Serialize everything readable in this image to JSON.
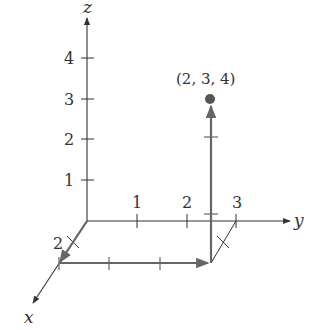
{
  "diagram": {
    "type": "3d-coordinate-axes",
    "axes": {
      "x": {
        "label": "x",
        "ticks": [
          1,
          2
        ],
        "tick_labels": [
          "2"
        ]
      },
      "y": {
        "label": "y",
        "ticks": [
          1,
          2,
          3
        ],
        "tick_labels": [
          "1",
          "2",
          "3"
        ]
      },
      "z": {
        "label": "z",
        "ticks": [
          1,
          2,
          3,
          4
        ],
        "tick_labels": [
          "1",
          "2",
          "3",
          "4"
        ]
      }
    },
    "point": {
      "label": "(2, 3, 4)",
      "coords": [
        2,
        3,
        4
      ],
      "color": "#555555"
    },
    "path": [
      {
        "from": [
          0,
          0,
          0
        ],
        "to": [
          2,
          0,
          0
        ],
        "note": "along x"
      },
      {
        "from": [
          2,
          0,
          0
        ],
        "to": [
          2,
          3,
          0
        ],
        "note": "parallel to y"
      },
      {
        "from": [
          2,
          3,
          0
        ],
        "to": [
          2,
          3,
          4
        ],
        "note": "parallel to z"
      }
    ],
    "colors": {
      "axes": "#333333",
      "path": "#666666",
      "point": "#555555"
    }
  },
  "labels": {
    "z_axis": "z",
    "y_axis": "y",
    "x_axis": "x",
    "z1": "1",
    "z2": "2",
    "z3": "3",
    "z4": "4",
    "y1": "1",
    "y2": "2",
    "y3": "3",
    "x2": "2",
    "point": "(2, 3, 4)"
  }
}
